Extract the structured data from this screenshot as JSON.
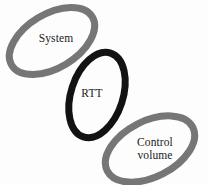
{
  "figure": {
    "kind": "chain-link-diagram",
    "background_color": "#fdfdfd",
    "width": 208,
    "height": 185,
    "ring_count": 3
  },
  "colors": {
    "gray_ring": "#767676",
    "black_ring": "#121212",
    "text": "#1b1b1b",
    "background": "#fdfdfd"
  },
  "rings": [
    {
      "id": "system",
      "label": "System",
      "color": "#767676",
      "tone": "gray",
      "position": "top-left",
      "center_x": 52,
      "center_y": 41,
      "radius_x": 47,
      "radius_y": 27,
      "rotation_deg": -31,
      "stroke_width": 7
    },
    {
      "id": "rtt",
      "label": "RTT",
      "color": "#121212",
      "tone": "black",
      "position": "middle",
      "center_x": 97,
      "center_y": 95,
      "radius_x": 44,
      "radius_y": 26,
      "rotation_deg": -72,
      "stroke_width": 7
    },
    {
      "id": "control-volume",
      "label": "Control\nvolume",
      "color": "#767676",
      "tone": "gray",
      "position": "bottom-right",
      "center_x": 150,
      "center_y": 149,
      "radius_x": 48,
      "radius_y": 28,
      "rotation_deg": -27,
      "stroke_width": 7
    }
  ],
  "labels": {
    "system": "System",
    "rtt": "RTT",
    "control_volume": "Control\nvolume"
  }
}
